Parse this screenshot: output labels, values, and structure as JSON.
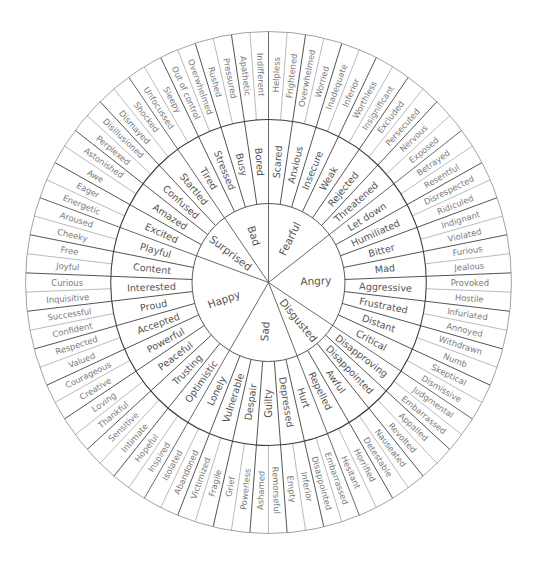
{
  "colors": {
    "background": "#ffffff",
    "core_line": "#555555",
    "mid_line": "#3d3d3d",
    "outer_line": "#8a8a8a",
    "core_text": "#555555",
    "outer_text": "#7a7a7a"
  },
  "wheel": [
    {
      "core": "Fearful",
      "middle": [
        {
          "label": "Scared",
          "outer": [
            "Helpless",
            "Frightened"
          ]
        },
        {
          "label": "Anxious",
          "outer": [
            "Overwhelmed",
            "Worried"
          ]
        },
        {
          "label": "Insecure",
          "outer": [
            "Inadequate",
            "Inferior"
          ]
        },
        {
          "label": "Weak",
          "outer": [
            "Worthless",
            "Insignificant"
          ]
        },
        {
          "label": "Rejected",
          "outer": [
            "Excluded",
            "Persecuted"
          ]
        },
        {
          "label": "Threatened",
          "outer": [
            "Nervous",
            "Exposed"
          ]
        }
      ]
    },
    {
      "core": "Angry",
      "middle": [
        {
          "label": "Let down",
          "outer": [
            "Betrayed",
            "Resentful"
          ]
        },
        {
          "label": "Humiliated",
          "outer": [
            "Disrespected",
            "Ridiculed"
          ]
        },
        {
          "label": "Bitter",
          "outer": [
            "Indignant",
            "Violated"
          ]
        },
        {
          "label": "Mad",
          "outer": [
            "Furious",
            "Jealous"
          ]
        },
        {
          "label": "Aggressive",
          "outer": [
            "Provoked",
            "Hostile"
          ]
        },
        {
          "label": "Frustrated",
          "outer": [
            "Infuriated",
            "Annoyed"
          ]
        },
        {
          "label": "Distant",
          "outer": [
            "Withdrawn",
            "Numb"
          ]
        },
        {
          "label": "Critical",
          "outer": [
            "Skeptical",
            "Dismissive"
          ]
        }
      ]
    },
    {
      "core": "Disgusted",
      "middle": [
        {
          "label": "Disapproving",
          "outer": [
            "Judgmental",
            "Embarrassed"
          ]
        },
        {
          "label": "Disappointed",
          "outer": [
            "Appalled",
            "Revolted"
          ]
        },
        {
          "label": "Awful",
          "outer": [
            "Nauseated",
            "Detestable"
          ]
        },
        {
          "label": "Repelled",
          "outer": [
            "Horrified",
            "Hesitant"
          ]
        }
      ]
    },
    {
      "core": "Sad",
      "middle": [
        {
          "label": "Hurt",
          "outer": [
            "Embarrassed",
            "Disappointed"
          ]
        },
        {
          "label": "Depressed",
          "outer": [
            "Inferior",
            "Empty"
          ]
        },
        {
          "label": "Guilty",
          "outer": [
            "Remorseful",
            "Ashamed"
          ]
        },
        {
          "label": "Despair",
          "outer": [
            "Powerless",
            "Grief"
          ]
        },
        {
          "label": "Vulnerable",
          "outer": [
            "Fragile",
            "Victimized"
          ]
        },
        {
          "label": "Lonely",
          "outer": [
            "Abandoned",
            "Isolated"
          ]
        }
      ]
    },
    {
      "core": "Happy",
      "middle": [
        {
          "label": "Optimistic",
          "outer": [
            "Inspired",
            "Hopeful"
          ]
        },
        {
          "label": "Trusting",
          "outer": [
            "Intimate",
            "Sensitive"
          ]
        },
        {
          "label": "Peaceful",
          "outer": [
            "Thankful",
            "Loving"
          ]
        },
        {
          "label": "Powerful",
          "outer": [
            "Creative",
            "Courageous"
          ]
        },
        {
          "label": "Accepted",
          "outer": [
            "Valued",
            "Respected"
          ]
        },
        {
          "label": "Proud",
          "outer": [
            "Confident",
            "Successful"
          ]
        },
        {
          "label": "Interested",
          "outer": [
            "Inquisitive",
            "Curious"
          ]
        },
        {
          "label": "Content",
          "outer": [
            "Joyful",
            "Free"
          ]
        },
        {
          "label": "Playful",
          "outer": [
            "Cheeky",
            "Aroused"
          ]
        }
      ]
    },
    {
      "core": "Surprised",
      "middle": [
        {
          "label": "Excited",
          "outer": [
            "Energetic",
            "Eager"
          ]
        },
        {
          "label": "Amazed",
          "outer": [
            "Awe",
            "Astonished"
          ]
        },
        {
          "label": "Confused",
          "outer": [
            "Perplexed",
            "Disillusioned"
          ]
        },
        {
          "label": "Startled",
          "outer": [
            "Dismayed",
            "Shocked"
          ]
        }
      ]
    },
    {
      "core": "Bad",
      "middle": [
        {
          "label": "Tired",
          "outer": [
            "Unfocussed",
            "Sleepy"
          ]
        },
        {
          "label": "Stressed",
          "outer": [
            "Out of control",
            "Overwhelmed"
          ]
        },
        {
          "label": "Busy",
          "outer": [
            "Rushed",
            "Pressured"
          ]
        },
        {
          "label": "Bored",
          "outer": [
            "Apathetic",
            "Indifferent"
          ]
        }
      ]
    }
  ]
}
